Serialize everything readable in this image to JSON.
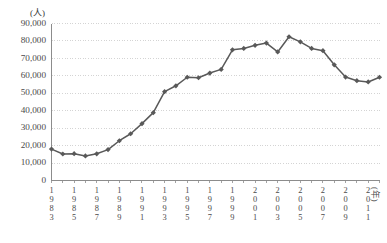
{
  "chart_data": {
    "type": "line",
    "title": "",
    "xlabel": "(年)",
    "ylabel": "(人)",
    "ylim": [
      0,
      90000
    ],
    "ytick_labels": [
      "90,000",
      "80,000",
      "70,000",
      "60,000",
      "50,000",
      "40,000",
      "30,000",
      "20,000",
      "10,000",
      "0"
    ],
    "ytick_values": [
      90000,
      80000,
      70000,
      60000,
      50000,
      40000,
      30000,
      20000,
      10000,
      0
    ],
    "grid": true,
    "legend": "none",
    "marker": "diamond",
    "series_color": "#595959",
    "x": [
      1983,
      1984,
      1985,
      1986,
      1987,
      1988,
      1989,
      1990,
      1991,
      1992,
      1993,
      1994,
      1995,
      1996,
      1997,
      1998,
      1999,
      2000,
      2001,
      2002,
      2003,
      2004,
      2005,
      2006,
      2007,
      2008,
      2009,
      2010,
      2011,
      2012
    ],
    "values": [
      18000,
      15200,
      15400,
      14100,
      15300,
      17700,
      22800,
      26800,
      32600,
      38900,
      50900,
      54300,
      59200,
      58900,
      61600,
      63700,
      74900,
      75700,
      77500,
      78800,
      73700,
      82400,
      79500,
      75700,
      74400,
      66300,
      59300,
      57200,
      56500,
      59200
    ],
    "xtick_labels": [
      {
        "year": "1983",
        "digits": [
          "1",
          "9",
          "8",
          "3"
        ]
      },
      {
        "year": "1985",
        "digits": [
          "1",
          "9",
          "8",
          "5"
        ]
      },
      {
        "year": "1987",
        "digits": [
          "1",
          "9",
          "8",
          "7"
        ]
      },
      {
        "year": "1989",
        "digits": [
          "1",
          "9",
          "8",
          "9"
        ]
      },
      {
        "year": "1991",
        "digits": [
          "1",
          "9",
          "9",
          "1"
        ]
      },
      {
        "year": "1993",
        "digits": [
          "1",
          "9",
          "9",
          "3"
        ]
      },
      {
        "year": "1995",
        "digits": [
          "1",
          "9",
          "9",
          "5"
        ]
      },
      {
        "year": "1997",
        "digits": [
          "1",
          "9",
          "9",
          "7"
        ]
      },
      {
        "year": "1999",
        "digits": [
          "1",
          "9",
          "9",
          "9"
        ]
      },
      {
        "year": "2001",
        "digits": [
          "2",
          "0",
          "0",
          "1"
        ]
      },
      {
        "year": "2003",
        "digits": [
          "2",
          "0",
          "0",
          "3"
        ]
      },
      {
        "year": "2005",
        "digits": [
          "2",
          "0",
          "0",
          "5"
        ]
      },
      {
        "year": "2007",
        "digits": [
          "2",
          "0",
          "0",
          "7"
        ]
      },
      {
        "year": "2009",
        "digits": [
          "2",
          "0",
          "0",
          "9"
        ]
      },
      {
        "year": "2011",
        "digits": [
          "2",
          "0",
          "1",
          "1"
        ]
      }
    ]
  }
}
